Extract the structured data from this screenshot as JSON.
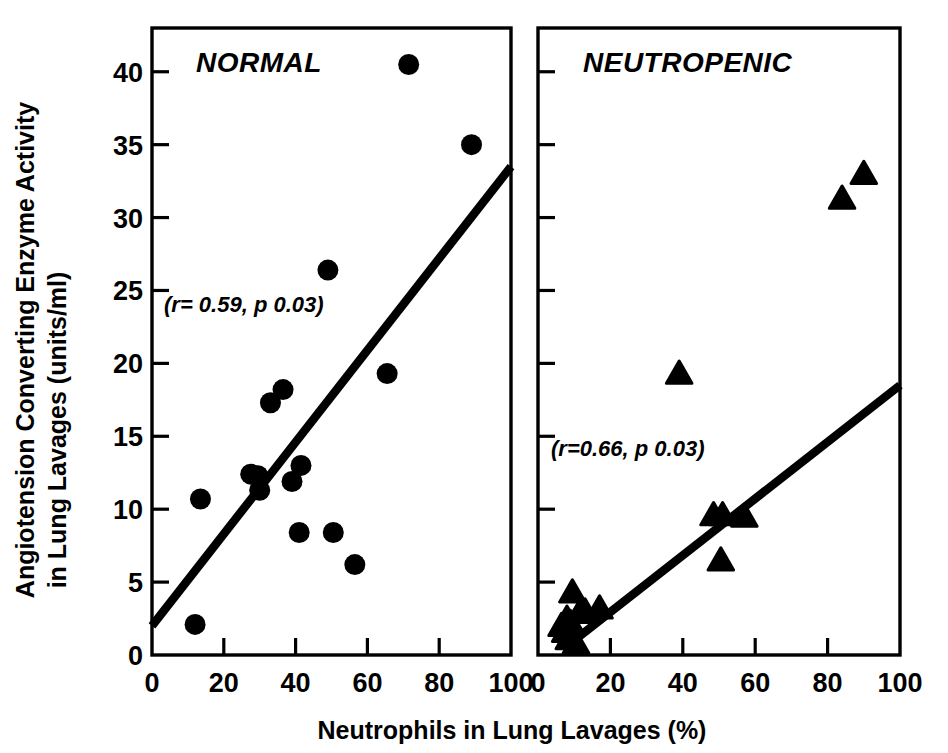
{
  "figure": {
    "background_color": "#ffffff",
    "ink_color": "#000000"
  },
  "axes": {
    "y_label": "Angiotension Converting Enzyme Activity in Lung Lavages (units/ml)",
    "y_label_line1": "Angiotension Converting Enzyme Activity",
    "y_label_line2": "in Lung Lavages (units/ml)",
    "x_label": "Neutrophils in Lung Lavages (%)",
    "y_ticks": [
      "0",
      "5",
      "10",
      "15",
      "20",
      "25",
      "30",
      "35",
      "40"
    ],
    "x_ticks": [
      "0",
      "20",
      "40",
      "60",
      "80",
      "100"
    ],
    "y_min": 0,
    "y_max": 43,
    "x_min": 0,
    "x_max": 100
  },
  "chart_data": {
    "type": "scatter",
    "title": "",
    "xlabel": "Neutrophils in Lung Lavages (%)",
    "ylabel": "Angiotension Converting Enzyme Activity in Lung Lavages (units/ml)",
    "xlim": [
      0,
      100
    ],
    "ylim": [
      0,
      43
    ],
    "xticks": [
      0,
      20,
      40,
      60,
      80,
      100
    ],
    "yticks": [
      0,
      5,
      10,
      15,
      20,
      25,
      30,
      35,
      40
    ],
    "grid": false,
    "legend": "none",
    "panels": [
      {
        "name": "normal",
        "title": "NORMAL",
        "marker": "circle",
        "annotation": "(r= 0.59, p 0.03)",
        "r": 0.59,
        "p": 0.03,
        "points": [
          {
            "x": 12.0,
            "y": 2.1
          },
          {
            "x": 13.5,
            "y": 10.7
          },
          {
            "x": 27.5,
            "y": 12.4
          },
          {
            "x": 29.5,
            "y": 12.3
          },
          {
            "x": 30.0,
            "y": 11.3
          },
          {
            "x": 33.0,
            "y": 17.3
          },
          {
            "x": 36.5,
            "y": 18.2
          },
          {
            "x": 39.0,
            "y": 11.9
          },
          {
            "x": 41.5,
            "y": 13.0
          },
          {
            "x": 41.0,
            "y": 8.4
          },
          {
            "x": 49.0,
            "y": 26.4
          },
          {
            "x": 50.5,
            "y": 8.4
          },
          {
            "x": 56.5,
            "y": 6.2
          },
          {
            "x": 65.5,
            "y": 19.3
          },
          {
            "x": 71.5,
            "y": 40.5
          },
          {
            "x": 89.0,
            "y": 35.0
          }
        ],
        "regression_line": {
          "x1": 0,
          "y1": 2.0,
          "x2": 100,
          "y2": 33.5
        }
      },
      {
        "name": "neutropenic",
        "title": "NEUTROPENIC",
        "marker": "triangle",
        "annotation": "(r=0.66, p 0.03)",
        "r": 0.66,
        "p": 0.03,
        "points": [
          {
            "x": 6.5,
            "y": 2.0
          },
          {
            "x": 7.5,
            "y": 1.6
          },
          {
            "x": 8.0,
            "y": 2.5
          },
          {
            "x": 8.5,
            "y": 1.1
          },
          {
            "x": 9.0,
            "y": 2.2
          },
          {
            "x": 9.5,
            "y": 4.3
          },
          {
            "x": 10.5,
            "y": 0.8
          },
          {
            "x": 11.5,
            "y": 2.9
          },
          {
            "x": 13.0,
            "y": 3.0
          },
          {
            "x": 17.0,
            "y": 3.2
          },
          {
            "x": 48.5,
            "y": 9.6
          },
          {
            "x": 51.0,
            "y": 9.6
          },
          {
            "x": 39.0,
            "y": 19.3
          },
          {
            "x": 50.5,
            "y": 6.5
          },
          {
            "x": 57.0,
            "y": 9.5
          },
          {
            "x": 84.0,
            "y": 31.3
          },
          {
            "x": 90.0,
            "y": 33.0
          }
        ],
        "regression_line": {
          "x1": 10.0,
          "y1": 1.0,
          "x2": 100,
          "y2": 18.5
        }
      }
    ]
  }
}
